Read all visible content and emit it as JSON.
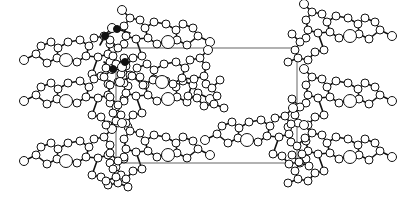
{
  "figure": {
    "type": "crystal-packing-diagram",
    "width": 414,
    "height": 212,
    "background": "#ffffff",
    "ink": "#111111",
    "unit_cell": {
      "x": 116,
      "y": 48,
      "width": 181,
      "height": 115,
      "color": "#555555"
    },
    "molecule_template": {
      "atoms": [
        [
          0,
          0,
          4.5
        ],
        [
          12,
          -6,
          4
        ],
        [
          17,
          -14,
          4
        ],
        [
          27,
          -18,
          4
        ],
        [
          34,
          -12,
          4
        ],
        [
          33,
          -2,
          4
        ],
        [
          23,
          3,
          4
        ],
        [
          42,
          0,
          6.5
        ],
        [
          44,
          -18,
          4
        ],
        [
          56,
          -20,
          4
        ],
        [
          65,
          -14,
          4
        ],
        [
          62,
          -4,
          4
        ],
        [
          53,
          2,
          4
        ],
        [
          70,
          -22,
          4
        ],
        [
          80,
          -24,
          4
        ],
        [
          86,
          -16,
          4
        ],
        [
          84,
          -6,
          4
        ],
        [
          74,
          -3,
          4
        ],
        [
          86,
          2,
          4
        ],
        [
          92,
          6,
          4
        ],
        [
          97,
          14,
          4
        ],
        [
          94,
          22,
          4
        ],
        [
          84,
          24,
          4
        ],
        [
          77,
          16,
          4
        ],
        [
          68,
          14,
          4
        ],
        [
          100,
          -2,
          4
        ],
        [
          88,
          -32,
          4.5
        ],
        [
          104,
          26,
          4
        ]
      ],
      "bonds": [
        [
          0,
          1
        ],
        [
          1,
          2
        ],
        [
          2,
          3
        ],
        [
          3,
          4
        ],
        [
          4,
          5
        ],
        [
          5,
          6
        ],
        [
          6,
          1
        ],
        [
          5,
          7
        ],
        [
          4,
          8
        ],
        [
          8,
          9
        ],
        [
          9,
          10
        ],
        [
          10,
          11
        ],
        [
          11,
          12
        ],
        [
          12,
          7
        ],
        [
          10,
          13
        ],
        [
          13,
          14
        ],
        [
          14,
          15
        ],
        [
          15,
          16
        ],
        [
          16,
          17
        ],
        [
          17,
          11
        ],
        [
          16,
          18
        ],
        [
          18,
          19
        ],
        [
          19,
          20
        ],
        [
          20,
          21
        ],
        [
          21,
          22
        ],
        [
          22,
          23
        ],
        [
          23,
          24
        ],
        [
          24,
          17
        ],
        [
          19,
          25
        ],
        [
          14,
          26
        ],
        [
          21,
          27
        ]
      ]
    },
    "molecules": [
      {
        "name": "row1-left",
        "x": 24,
        "y": 60,
        "flip": false,
        "dark_atoms": []
      },
      {
        "name": "row2-left",
        "x": 24,
        "y": 101,
        "flip": false,
        "dark_atoms": []
      },
      {
        "name": "row3-left",
        "x": 24,
        "y": 161,
        "flip": false,
        "dark_atoms": []
      },
      {
        "name": "row1-right",
        "x": 392,
        "y": 36,
        "flip": true,
        "dark_atoms": []
      },
      {
        "name": "row2-right",
        "x": 392,
        "y": 101,
        "flip": true,
        "dark_atoms": []
      },
      {
        "name": "row3-right",
        "x": 392,
        "y": 157,
        "flip": true,
        "dark_atoms": []
      },
      {
        "name": "row1-middle",
        "x": 210,
        "y": 42,
        "flip": true,
        "dark_atoms": []
      },
      {
        "name": "row2-middle",
        "x": 210,
        "y": 99,
        "flip": true,
        "dark_atoms": []
      },
      {
        "name": "row3-middle",
        "x": 210,
        "y": 155,
        "flip": true,
        "dark_atoms": []
      },
      {
        "name": "center-left",
        "x": 120,
        "y": 82,
        "flip": false,
        "dark_atoms": []
      },
      {
        "name": "center-right",
        "x": 205,
        "y": 140,
        "flip": false,
        "dark_atoms": []
      }
    ],
    "highlighted_atoms": [
      {
        "x": 105,
        "y": 36,
        "r": 3.5
      },
      {
        "x": 117,
        "y": 29,
        "r": 3.5
      },
      {
        "x": 125,
        "y": 62,
        "r": 3.5
      },
      {
        "x": 113,
        "y": 69,
        "r": 3.5
      }
    ],
    "highlighted_bonds": [
      [
        105,
        36,
        117,
        29
      ],
      [
        117,
        29,
        130,
        33
      ],
      [
        125,
        62,
        113,
        69
      ],
      [
        125,
        62,
        132,
        55
      ],
      [
        100,
        45,
        105,
        36
      ],
      [
        113,
        69,
        104,
        62
      ]
    ]
  }
}
